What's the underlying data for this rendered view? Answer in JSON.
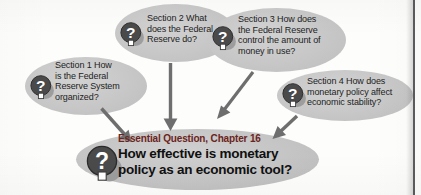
{
  "diagram": {
    "accent_color": "#6b2420",
    "bubble_color": "#c7c7c7",
    "text_color": "#1d1d1d",
    "page_edge_color": "#5c5c5c",
    "icon": {
      "name": "question-mark-medallion-icon",
      "glyph": "?",
      "disc_color": "#4a4a4a",
      "glyph_color": "#ffffff"
    },
    "sections": [
      {
        "id": "section-1",
        "label": "Section 1  How\nis the Federal\nReserve System\norganized?"
      },
      {
        "id": "section-2",
        "label": "Section 2  What\ndoes the Federal\nReserve do?"
      },
      {
        "id": "section-3",
        "label": "Section 3  How does\nthe  Federal Reserve\ncontrol the amount of\nmoney in use?"
      },
      {
        "id": "section-4",
        "label": "Section 4  How does\nmonetary policy affect\neconomic stability?"
      }
    ],
    "essential": {
      "eyebrow": "Essential Question, Chapter 16",
      "question": "How effective is monetary\npolicy as an economic tool?"
    },
    "arrows": [
      {
        "id": "arrow-section-1",
        "direction": "down-right"
      },
      {
        "id": "arrow-section-2",
        "direction": "down"
      },
      {
        "id": "arrow-section-3",
        "direction": "down-left"
      },
      {
        "id": "arrow-section-4",
        "direction": "down-left"
      }
    ]
  }
}
